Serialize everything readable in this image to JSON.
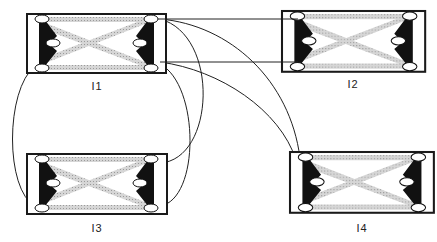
{
  "diagram": {
    "type": "interconnect",
    "colors": {
      "frame": "#1a1a1a",
      "band": "#c8c8c8",
      "bracket": "#111111",
      "node_fill": "#ffffff",
      "wire": "#222222"
    },
    "modules": [
      {
        "id": "I1",
        "label": "I1",
        "x": 27,
        "y": 14,
        "w": 139,
        "h": 59,
        "label_x": 97,
        "label_y": 88
      },
      {
        "id": "I2",
        "label": "I2",
        "x": 282,
        "y": 11,
        "w": 143,
        "h": 61,
        "label_x": 353,
        "label_y": 86
      },
      {
        "id": "I3",
        "label": "I3",
        "x": 27,
        "y": 154,
        "w": 140,
        "h": 60,
        "label_x": 97,
        "label_y": 230
      },
      {
        "id": "I4",
        "label": "I4",
        "x": 290,
        "y": 152,
        "w": 144,
        "h": 61,
        "label_x": 362,
        "label_y": 230
      }
    ],
    "connections": [
      {
        "from": "I1.top-right",
        "to": "I2.top-left",
        "shape": "straight"
      },
      {
        "from": "I1.bottom-right",
        "to": "I2.bottom-left",
        "shape": "straight"
      },
      {
        "from": "I1.top-right",
        "to": "I4.top-left",
        "shape": "curve"
      },
      {
        "from": "I1.bottom-right",
        "to": "I4.top-left",
        "shape": "curve"
      },
      {
        "from": "I1.top-right",
        "to": "I3.top-right",
        "shape": "curve"
      },
      {
        "from": "I1.bottom-right",
        "to": "I3.bottom-right",
        "shape": "curve"
      },
      {
        "from": "I1.bottom-left",
        "to": "I3.bottom-left",
        "shape": "curve"
      }
    ]
  }
}
